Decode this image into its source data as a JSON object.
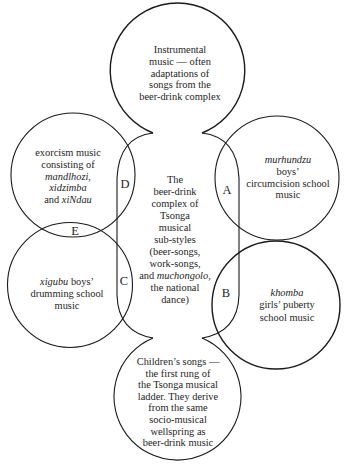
{
  "figure": {
    "top_circle": {
      "lines": [
        "Instrumental",
        "music — often",
        "adaptations of",
        "songs from the",
        "beer-drink complex"
      ]
    },
    "center_region": {
      "lines": [
        "The",
        "beer-drink",
        "complex of",
        "Tsonga",
        "musical",
        "sub-styles",
        "(beer-songs,",
        "work-songs,"
      ],
      "line9": {
        "prefix": "and ",
        "italic": "muchongolo",
        "suffix": ","
      },
      "line10": "the national",
      "line11": "dance)"
    },
    "left_upper_circle": {
      "lines": [
        "exorcism music",
        "consisting of"
      ],
      "italic_lines": [
        "mandlhozi,",
        "xidzimba"
      ],
      "last_line": {
        "prefix": "and ",
        "italic": "xiNdau"
      }
    },
    "left_lower_circle": {
      "line1": {
        "italic": "xigubu",
        "suffix": " boys’"
      },
      "lines": [
        "drumming school",
        "music"
      ]
    },
    "right_upper_circle": {
      "italic_title": "murhundzu",
      "lines": [
        "boys’",
        "circumcision school",
        "music"
      ]
    },
    "right_lower_circle": {
      "italic_title": "khomba",
      "lines": [
        "girls’ puberty",
        "school music"
      ]
    },
    "bottom_circle": {
      "lines": [
        "Children’s songs —",
        "the first rung of",
        "the Tsonga musical",
        "ladder. They derive",
        "from the same",
        "socio-musical",
        "wellspring as",
        "beer-drink music"
      ]
    },
    "overlap_labels": {
      "A": "A",
      "B": "B",
      "C": "C",
      "D": "D",
      "E": "E"
    }
  },
  "colors": {
    "line": "#1a1a1a",
    "text": "#1e1e1e",
    "background": "#ffffff"
  }
}
